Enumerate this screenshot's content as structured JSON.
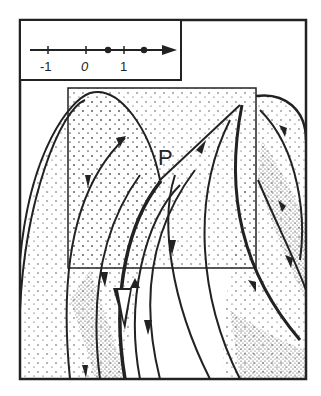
{
  "diagram": {
    "type": "phase-portrait",
    "point_label": "P",
    "number_line": {
      "ticks": [
        "-1",
        "0",
        "1"
      ],
      "marked_points": 2,
      "arrow_direction": "right"
    },
    "colors": {
      "ink": "#222222",
      "paper": "#ffffff"
    }
  }
}
